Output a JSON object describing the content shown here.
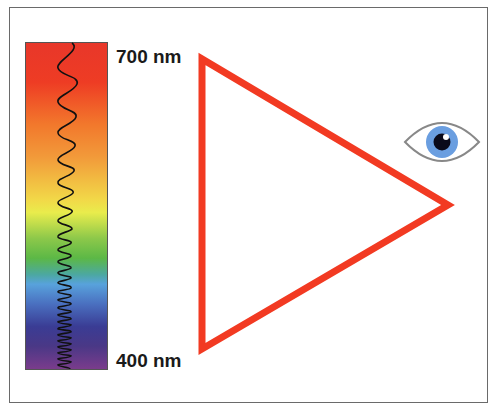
{
  "labels": {
    "top": "700 nm",
    "bottom": "400 nm"
  },
  "colors": {
    "triangle": "#f23a22",
    "iris": "#6a9ee0",
    "pupil": "#0a0a1a",
    "eye_outline": "#808080"
  },
  "spectrum": {
    "top_wavelength_nm": 700,
    "bottom_wavelength_nm": 400
  }
}
